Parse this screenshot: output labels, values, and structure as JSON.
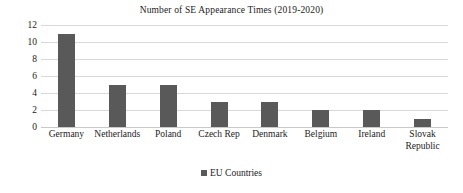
{
  "chart_data": {
    "type": "bar",
    "title": "Number of SE Appearance Times (2019-2020)",
    "xlabel": "",
    "ylabel": "",
    "categories": [
      "Germany",
      "Netherlands",
      "Poland",
      "Czech Rep",
      "Denmark",
      "Belgium",
      "Ireland",
      "Slovak Republic"
    ],
    "values": [
      11,
      5,
      5,
      3,
      3,
      2,
      2,
      1
    ],
    "series": [
      {
        "name": "EU Countries",
        "values": [
          11,
          5,
          5,
          3,
          3,
          2,
          2,
          1
        ]
      }
    ],
    "ylim": [
      0,
      12
    ],
    "ytick_labels": [
      "0",
      "2",
      "4",
      "6",
      "8",
      "10",
      "12"
    ],
    "ytick_values": [
      0,
      2,
      4,
      6,
      8,
      10,
      12
    ],
    "grid": true,
    "legend_position": "bottom",
    "legend": [
      "EU Countries"
    ],
    "bar_color": "#595959",
    "gridline_color": "#d9d9d9",
    "background_color": "#ffffff"
  },
  "legend": {
    "label": "EU Countries",
    "marker": "square-marker"
  }
}
